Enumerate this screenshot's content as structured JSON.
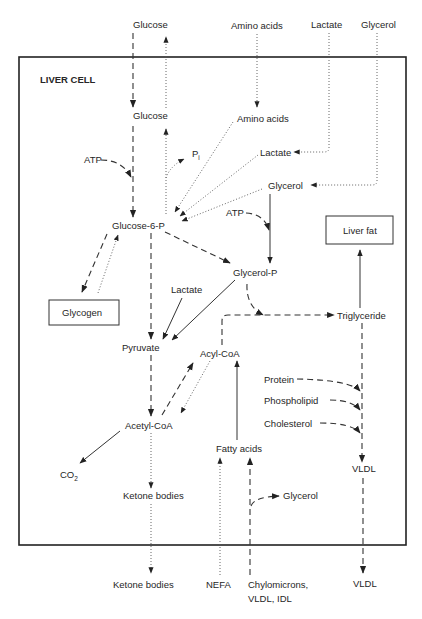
{
  "diagram": {
    "title": "LIVER CELL",
    "external_inputs": {
      "glucose": "Glucose",
      "amino_acids": "Amino acids",
      "lactate": "Lactate",
      "glycerol": "Glycerol"
    },
    "nodes": {
      "glucose": "Glucose",
      "amino_acids": "Amino acids",
      "lactate_upper": "Lactate",
      "glycerol_upper": "Glycerol",
      "atp_left": "ATP",
      "pi": "P",
      "pi_sub": "i",
      "glucose_6_p": "Glucose-6-P",
      "atp_right": "ATP",
      "liver_fat": "Liver fat",
      "glycerol_p": "Glycerol-P",
      "lactate_mid": "Lactate",
      "glycogen": "Glycogen",
      "triglyceride": "Triglyceride",
      "pyruvate": "Pyruvate",
      "acyl_coa": "Acyl-CoA",
      "protein": "Protein",
      "phospholipid": "Phospholipid",
      "cholesterol": "Cholesterol",
      "acetyl_coa": "Acetyl-CoA",
      "fatty_acids": "Fatty acids",
      "vldl_inner": "VLDL",
      "co2": "CO",
      "co2_sub": "2",
      "ketone_bodies_inner": "Ketone bodies",
      "glycerol_lower": "Glycerol"
    },
    "external_outputs": {
      "ketone_bodies": "Ketone bodies",
      "nefa": "NEFA",
      "chylomicrons_line1": "Chylomicrons,",
      "chylomicrons_line2": "VLDL, IDL",
      "vldl": "VLDL"
    },
    "line_styles": {
      "solid": "solid",
      "dashed": "dashed",
      "dotted": "dotted"
    }
  }
}
